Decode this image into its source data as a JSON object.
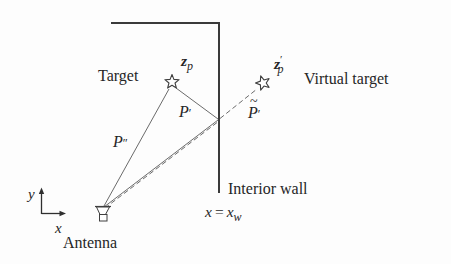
{
  "figure": {
    "colors": {
      "background": "#fdfdfd",
      "wall_line": "#3a3a3a",
      "path_line": "#6b6b6b",
      "text": "#262626",
      "marker_fill": "#ffffff"
    }
  },
  "icons": {
    "target_marker": "star-outline",
    "virtual_target_marker": "star-outline",
    "antenna_marker": "horn-antenna",
    "axes_marker": "xy-axes-arrows"
  },
  "labels": {
    "target": "Target",
    "virtual_target": "Virtual target",
    "antenna": "Antenna",
    "interior_wall": "Interior wall"
  },
  "math": {
    "z_p": {
      "base": "z",
      "sub": "p"
    },
    "z_p_prime": {
      "base": "z",
      "prime": "′",
      "sub": "p"
    },
    "path_direct": {
      "base": "P",
      "marks": "″"
    },
    "path_reflected": {
      "base": "P",
      "marks": "′"
    },
    "path_virtual": {
      "tilde": "~",
      "base": "P",
      "marks": "′"
    },
    "wall_equation": {
      "lhs": "x",
      "rel": "=",
      "rhs_base": "x",
      "rhs_sub": "w"
    },
    "axis_x": "x",
    "axis_y": "y"
  }
}
